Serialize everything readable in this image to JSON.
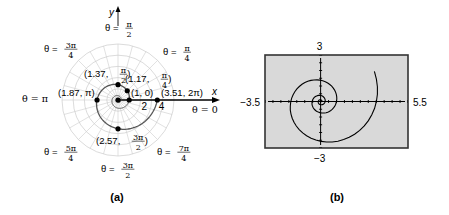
{
  "chart_data": [
    {
      "panel": "a",
      "type": "line",
      "coordinate_system": "polar",
      "caption": "(a)",
      "equation": "r = e^(θ/5)",
      "xlabel": "x",
      "ylabel": "y",
      "r_rings": [
        1,
        2,
        3,
        4,
        5
      ],
      "r_tick_labels": [
        "2",
        "4"
      ],
      "theta_range": [
        0,
        6.283185
      ],
      "angle_labels": [
        {
          "num": "",
          "den": "",
          "text": "θ = 0",
          "angle_deg": 0
        },
        {
          "num": "π",
          "den": "4",
          "text": "θ = ",
          "angle_deg": 45
        },
        {
          "num": "π",
          "den": "2",
          "text": "θ = ",
          "angle_deg": 90
        },
        {
          "num": "3π",
          "den": "4",
          "text": "θ = ",
          "angle_deg": 135
        },
        {
          "num": "",
          "den": "",
          "text": "θ = π",
          "angle_deg": 180
        },
        {
          "num": "5π",
          "den": "4",
          "text": "θ = ",
          "angle_deg": 225
        },
        {
          "num": "3π",
          "den": "2",
          "text": "θ = ",
          "angle_deg": 270
        },
        {
          "num": "7π",
          "den": "4",
          "text": "θ = ",
          "angle_deg": 315
        }
      ],
      "points": [
        {
          "r": 1,
          "theta": 0,
          "label": "(1, 0)"
        },
        {
          "r": 1.17,
          "theta": 0.785398,
          "label_pre": "(1.17, ",
          "num": "π",
          "den": "4",
          "label_post": ")"
        },
        {
          "r": 1.37,
          "theta": 1.570796,
          "label_pre": "(1.37, ",
          "num": "π",
          "den": "2",
          "label_post": ")"
        },
        {
          "r": 1.87,
          "theta": 3.141593,
          "label": "(1.87, π)"
        },
        {
          "r": 2.57,
          "theta": 4.712389,
          "label_pre": "(2.57, ",
          "num": "3π",
          "den": "2",
          "label_post": ")"
        },
        {
          "r": 3.51,
          "theta": 6.283185,
          "label": "(3.51, 2π)"
        }
      ],
      "colors": {
        "grid": "#cccccc",
        "curve": "#555555",
        "points": "#000000",
        "axis": "#000000"
      }
    },
    {
      "panel": "b",
      "type": "line",
      "caption": "(b)",
      "description": "graphing calculator window",
      "equation": "r = e^(θ/5)",
      "xlim": [
        -3.5,
        5.5
      ],
      "ylim": [
        -3,
        3
      ],
      "xmin_label": "−3.5",
      "xmax_label": "5.5",
      "ymin_label": "−3",
      "ymax_label": "3",
      "theta_range": [
        -12.566,
        6.9
      ],
      "colors": {
        "screen": "#d9d9d9",
        "curve": "#000000",
        "frame": "#333333"
      }
    }
  ]
}
